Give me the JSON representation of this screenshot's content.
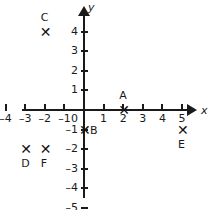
{
  "chart_data": {
    "type": "scatter",
    "title": "",
    "xlabel": "x",
    "ylabel": "y",
    "xlim": [
      -4,
      5
    ],
    "ylim": [
      -5,
      4
    ],
    "grid": false,
    "legend": "none",
    "x_ticks": [
      "–4",
      "–3",
      "–2",
      "–1",
      "1",
      "2",
      "3",
      "4",
      "5"
    ],
    "x_tick_values": [
      -4,
      -3,
      -2,
      -1,
      1,
      2,
      3,
      4,
      5
    ],
    "y_ticks": [
      "4",
      "3",
      "2",
      "1",
      "–1",
      "–2",
      "–3",
      "–4",
      "–5"
    ],
    "y_tick_values": [
      4,
      3,
      2,
      1,
      -1,
      -2,
      -3,
      -4,
      -5
    ],
    "origin_label": "0",
    "points": [
      {
        "label": "A",
        "x": 2,
        "y": 0,
        "label_pos": "above",
        "marker": "x-marker"
      },
      {
        "label": "B",
        "x": 0,
        "y": -1,
        "label_pos": "right",
        "marker": "x-marker"
      },
      {
        "label": "C",
        "x": -2,
        "y": 4,
        "label_pos": "above",
        "marker": "x-marker"
      },
      {
        "label": "D",
        "x": -3,
        "y": -2,
        "label_pos": "below",
        "marker": "x-marker"
      },
      {
        "label": "E",
        "x": 5,
        "y": -1,
        "label_pos": "below",
        "marker": "x-marker"
      },
      {
        "label": "F",
        "x": -2,
        "y": -2,
        "label_pos": "below",
        "marker": "x-marker"
      }
    ],
    "marker_glyph": "✕",
    "colors": {
      "axis": "#1a1a1a",
      "marker": "#111111",
      "background": "#ffffff"
    }
  }
}
